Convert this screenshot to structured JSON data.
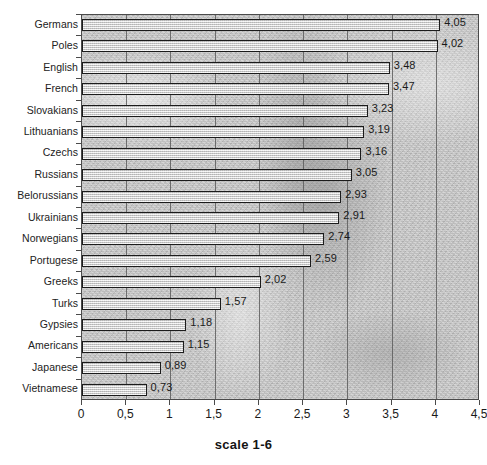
{
  "chart_data": {
    "type": "bar",
    "orientation": "horizontal",
    "title": "",
    "subtitle": "",
    "xlabel": "scale 1-6",
    "ylabel": "",
    "xlim": [
      0,
      4.5
    ],
    "ylim": null,
    "grid": true,
    "legend": null,
    "legend_position": "none",
    "decimal_separator": ",",
    "categories": [
      "Germans",
      "Poles",
      "English",
      "French",
      "Slovakians",
      "Lithuanians",
      "Czechs",
      "Russians",
      "Belorussians",
      "Ukrainians",
      "Norwegians",
      "Portugese",
      "Greeks",
      "Turks",
      "Gypsies",
      "Americans",
      "Japanese",
      "Vietnamese"
    ],
    "values": [
      4.05,
      4.02,
      3.48,
      3.47,
      3.23,
      3.19,
      3.16,
      3.05,
      2.93,
      2.91,
      2.74,
      2.59,
      2.02,
      1.57,
      1.18,
      1.15,
      0.89,
      0.73
    ],
    "data_labels": [
      "4,05",
      "4,02",
      "3,48",
      "3,47",
      "3,23",
      "3,19",
      "3,16",
      "3,05",
      "2,93",
      "2,91",
      "2,74",
      "2,59",
      "2,02",
      "1,57",
      "1,18",
      "1,15",
      "0,89",
      "0,73"
    ],
    "xticks": [
      0,
      0.5,
      1,
      1.5,
      2,
      2.5,
      3,
      3.5,
      4,
      4.5
    ],
    "xtick_labels": [
      "0",
      "0,5",
      "1",
      "1,5",
      "2",
      "2,5",
      "3",
      "3,5",
      "4",
      "4,5"
    ],
    "colors": {
      "bar_fill": "#d8d8d8",
      "bar_border": "#1b1b1b",
      "plot_background": "#c6c6c6",
      "gridline": "#5d5d5d",
      "axis": "#4a4a4a",
      "text": "#1a1a1a"
    }
  },
  "axis_title": {
    "text": "scale 1-6"
  }
}
